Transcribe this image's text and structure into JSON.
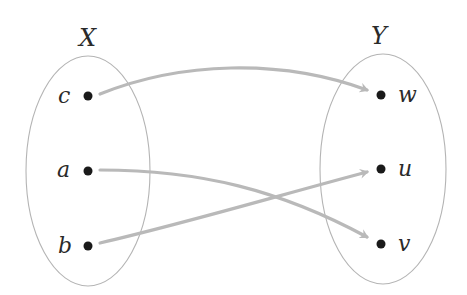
{
  "diagram": {
    "type": "function-mapping",
    "sets": [
      {
        "name": "X",
        "elements": [
          "c",
          "a",
          "b"
        ]
      },
      {
        "name": "Y",
        "elements": [
          "w",
          "u",
          "v"
        ]
      }
    ],
    "mappings": [
      {
        "from": "c",
        "to": "w"
      },
      {
        "from": "a",
        "to": "v"
      },
      {
        "from": "b",
        "to": "u"
      }
    ],
    "colors": {
      "ellipse": "#b4b4b4",
      "arrow": "#b9b9b9",
      "dot": "#1a1a1a",
      "text": "#2a2a2a"
    }
  }
}
